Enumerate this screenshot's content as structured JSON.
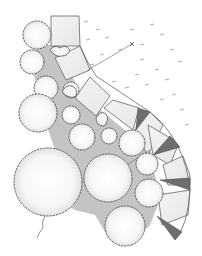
{
  "figure": {
    "type": "landscape-plan-drawing",
    "description": "Hand-drawn garden plan: curved stepping-slab path bordered by tree canopies and shaded ground cover, lawn with grass tufts to the right",
    "colors": {
      "background": "#ffffff",
      "outline": "#555555",
      "groundcover": "#bdbdbd",
      "slab": "#efefef",
      "dark_wedge": "#6e6e6e",
      "canopy_fill": "#f7f7f7",
      "grass_tuft": "#9a9a9a"
    },
    "elements": {
      "slab_count": 8,
      "dark_wedge_count": 4,
      "tree_canopy_count": 14,
      "dimension_lines": 2,
      "markers": [
        "x-marker",
        "x-marker"
      ]
    }
  }
}
